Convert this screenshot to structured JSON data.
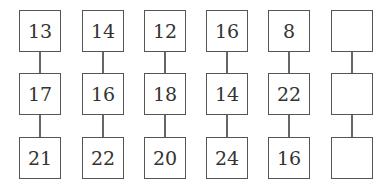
{
  "puzzle": {
    "columns": [
      {
        "values": [
          "13",
          "17",
          "21"
        ]
      },
      {
        "values": [
          "14",
          "16",
          "22"
        ]
      },
      {
        "values": [
          "12",
          "18",
          "20"
        ]
      },
      {
        "values": [
          "16",
          "14",
          "24"
        ]
      },
      {
        "values": [
          "8",
          "22",
          "16"
        ]
      },
      {
        "values": [
          "",
          "",
          ""
        ]
      }
    ]
  }
}
